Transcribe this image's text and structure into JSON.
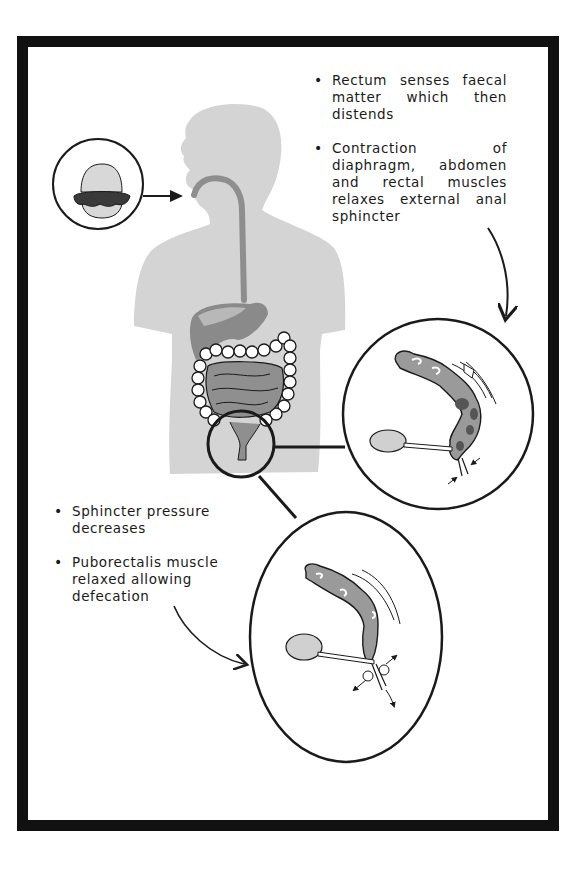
{
  "diagram": {
    "top_notes": [
      "Rectum senses faecal matter which then distends",
      "Contraction of diaphragm, abdomen and rectal muscles relaxes external anal sphincter"
    ],
    "bottom_notes": [
      "Sphincter pressure decreases",
      "Puborectalis muscle relaxed allowing defecation"
    ],
    "elements": {
      "food_inset": "hamburger-icon",
      "body": "human-silhouette-with-digestive-tract",
      "detail_circle": "rectum-zoom-circle",
      "inset_1": "rectum-distended-contracting",
      "inset_2": "rectum-relaxed-defecation"
    },
    "colors": {
      "frame": "#111111",
      "silhouette": "#d4d4d4",
      "organ_dark": "#8a8a8a",
      "organ_mid": "#a6a6a6",
      "ink": "#1a1a1a"
    }
  }
}
